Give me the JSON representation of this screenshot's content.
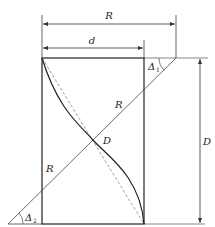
{
  "diagram": {
    "type": "geometric-construction",
    "labels": {
      "R_top": "R",
      "d_top": "d",
      "R_diag_upper": "R",
      "R_diag_lower": "R",
      "D_center": "D",
      "D_right": "D",
      "delta1": "Δ",
      "delta1_sub": "1",
      "delta2": "Δ",
      "delta2_sub": "2"
    },
    "colors": {
      "line": "#333333",
      "thin": "#555555",
      "dashed": "#888888"
    }
  }
}
